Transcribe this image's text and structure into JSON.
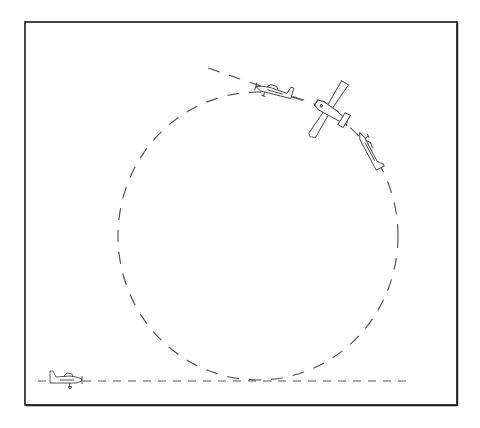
{
  "diagram": {
    "type": "flight-maneuver",
    "colors": {
      "background": "#ffffff",
      "frame": "#1a1a1a",
      "path": "#555555",
      "aircraft": "#444444"
    },
    "frame": {
      "x": 25,
      "y": 22,
      "width": 432,
      "height": 383
    },
    "loop": {
      "cx": 258,
      "cy": 236,
      "rx": 140,
      "ry": 144
    },
    "ground_line": {
      "x1": 38,
      "x2": 410,
      "y": 381
    },
    "entry_exit_line": {
      "x1": 208,
      "y1": 68,
      "x2": 310,
      "y2": 103
    },
    "aircraft": [
      {
        "id": "level-entry",
        "x": 62,
        "y": 379,
        "rotation": 0,
        "view": "side",
        "scale": 1
      },
      {
        "id": "top-of-loop",
        "x": 275,
        "y": 92,
        "rotation": 16,
        "view": "side",
        "scale": 1
      },
      {
        "id": "inverted-plan",
        "x": 328,
        "y": 110,
        "rotation": 32,
        "view": "plan",
        "scale": 1
      },
      {
        "id": "descending",
        "x": 370,
        "y": 152,
        "rotation": 62,
        "view": "side-thin",
        "scale": 1
      }
    ]
  }
}
